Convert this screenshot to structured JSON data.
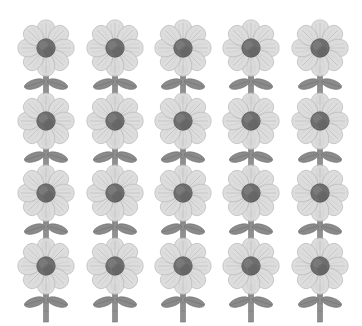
{
  "canvas": {
    "width": 362,
    "height": 326,
    "background_color": "#ffffff",
    "subject": "grid of identical stylized daisy flowers",
    "rendering_style": "grayscale watercolor clip-art"
  },
  "grid": {
    "columns": 5,
    "rows": 4,
    "total_items": 20,
    "column_centers_x": [
      46,
      115,
      183,
      251,
      320
    ],
    "row_centers_y": [
      48,
      121,
      193,
      266
    ],
    "column_pitch": 68,
    "row_pitch": 73
  },
  "flower": {
    "name": "daisy-flower",
    "petal_count": 8,
    "petal_fill_color": "#dcdcdc",
    "petal_edge_color": "#b4b4b4",
    "petal_vein_color": "#a8a8a8",
    "center_color": "#6e6e6e",
    "center_shadow_color": "#5a5a5a",
    "center_highlight_color": "#8a8a8a",
    "stem_color": "#8f8f8f",
    "stem_edge_color": "#757575",
    "leaf_color": "#8a8a8a",
    "leaf_edge_color": "#6f6f6f",
    "leaf_vein_color": "#6a6a6a",
    "leaf_count": 2
  },
  "items": [
    {
      "id": "flower-r1-c1",
      "row": 1,
      "column": 1,
      "cx": 46,
      "cy": 48
    },
    {
      "id": "flower-r1-c2",
      "row": 1,
      "column": 2,
      "cx": 115,
      "cy": 48
    },
    {
      "id": "flower-r1-c3",
      "row": 1,
      "column": 3,
      "cx": 183,
      "cy": 48
    },
    {
      "id": "flower-r1-c4",
      "row": 1,
      "column": 4,
      "cx": 251,
      "cy": 48
    },
    {
      "id": "flower-r1-c5",
      "row": 1,
      "column": 5,
      "cx": 320,
      "cy": 48
    },
    {
      "id": "flower-r2-c1",
      "row": 2,
      "column": 1,
      "cx": 46,
      "cy": 121
    },
    {
      "id": "flower-r2-c2",
      "row": 2,
      "column": 2,
      "cx": 115,
      "cy": 121
    },
    {
      "id": "flower-r2-c3",
      "row": 2,
      "column": 3,
      "cx": 183,
      "cy": 121
    },
    {
      "id": "flower-r2-c4",
      "row": 2,
      "column": 4,
      "cx": 251,
      "cy": 121
    },
    {
      "id": "flower-r2-c5",
      "row": 2,
      "column": 5,
      "cx": 320,
      "cy": 121
    },
    {
      "id": "flower-r3-c1",
      "row": 3,
      "column": 1,
      "cx": 46,
      "cy": 193
    },
    {
      "id": "flower-r3-c2",
      "row": 3,
      "column": 2,
      "cx": 115,
      "cy": 193
    },
    {
      "id": "flower-r3-c3",
      "row": 3,
      "column": 3,
      "cx": 183,
      "cy": 193
    },
    {
      "id": "flower-r3-c4",
      "row": 3,
      "column": 4,
      "cx": 251,
      "cy": 193
    },
    {
      "id": "flower-r3-c5",
      "row": 3,
      "column": 5,
      "cx": 320,
      "cy": 193
    },
    {
      "id": "flower-r4-c1",
      "row": 4,
      "column": 1,
      "cx": 46,
      "cy": 266
    },
    {
      "id": "flower-r4-c2",
      "row": 4,
      "column": 2,
      "cx": 115,
      "cy": 266
    },
    {
      "id": "flower-r4-c3",
      "row": 4,
      "column": 3,
      "cx": 183,
      "cy": 266
    },
    {
      "id": "flower-r4-c4",
      "row": 4,
      "column": 4,
      "cx": 251,
      "cy": 266
    },
    {
      "id": "flower-r4-c5",
      "row": 4,
      "column": 5,
      "cx": 320,
      "cy": 266
    }
  ]
}
